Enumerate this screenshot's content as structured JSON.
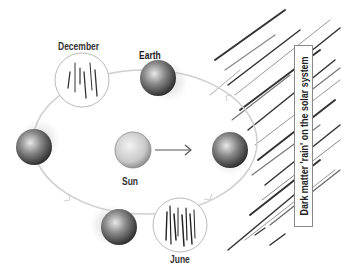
{
  "diagram": {
    "title": "Dark matter 'rain' on the solar system",
    "labels": {
      "december": "December",
      "earth": "Earth",
      "sun": "Sun",
      "june": "June"
    },
    "nodes": [
      {
        "id": "earth-december",
        "type": "earth",
        "position": "top"
      },
      {
        "id": "earth-left",
        "type": "earth",
        "position": "left"
      },
      {
        "id": "earth-june",
        "type": "earth",
        "position": "bottom"
      },
      {
        "id": "earth-right",
        "type": "earth",
        "position": "right"
      },
      {
        "id": "sun",
        "type": "sun",
        "position": "center"
      },
      {
        "id": "december-inset",
        "type": "rain-inset",
        "label": "December"
      },
      {
        "id": "june-inset",
        "type": "rain-inset",
        "label": "June"
      }
    ],
    "edges": [
      {
        "from": "sun",
        "to": "earth-right",
        "type": "arrow"
      }
    ],
    "orbit": "Earth orbit around Sun (counter-clockwise arrows)",
    "colors": {
      "orbit": "#cfcfcf",
      "text": "#333333",
      "rain": "#333333"
    }
  }
}
